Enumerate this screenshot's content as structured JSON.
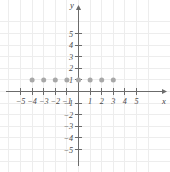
{
  "chart_data": {
    "type": "scatter",
    "title": "",
    "xlabel": "x",
    "ylabel": "y",
    "xlim": [
      -5.8,
      5.8
    ],
    "ylim": [
      -5.8,
      5.8
    ],
    "grid": true,
    "legend": null,
    "x_ticks": [
      -5,
      -4,
      -3,
      -2,
      -1,
      1,
      2,
      3,
      4,
      5
    ],
    "y_ticks": [
      -5,
      -4,
      -3,
      -2,
      -1,
      1,
      2,
      3,
      4,
      5
    ],
    "x_tick_labels": [
      "-5",
      "-4",
      "-3",
      "-2",
      "-1",
      "1",
      "2",
      "3",
      "4",
      "5"
    ],
    "y_tick_labels": [
      "-5",
      "-4",
      "-3",
      "-2",
      "-1",
      "1",
      "2",
      "3",
      "4",
      "5"
    ],
    "series": [
      {
        "name": "points",
        "marker": "circle",
        "color": "#a8a8a8",
        "x": [
          -4,
          -3,
          -2,
          -1,
          0,
          1,
          2,
          3
        ],
        "y": [
          1,
          1,
          1,
          1,
          1,
          1,
          1,
          1
        ],
        "points": [
          {
            "x": -4,
            "y": 1
          },
          {
            "x": -3,
            "y": 1
          },
          {
            "x": -2,
            "y": 1
          },
          {
            "x": -1,
            "y": 1
          },
          {
            "x": 0,
            "y": 1
          },
          {
            "x": 1,
            "y": 1
          },
          {
            "x": 2,
            "y": 1
          },
          {
            "x": 3,
            "y": 1
          }
        ]
      }
    ]
  },
  "colors": {
    "background": "#ffffff",
    "grid": "#ededed",
    "axis": "#6b6b6b",
    "tick_text": "#4a4a4a",
    "point": "#a8a8a8"
  }
}
